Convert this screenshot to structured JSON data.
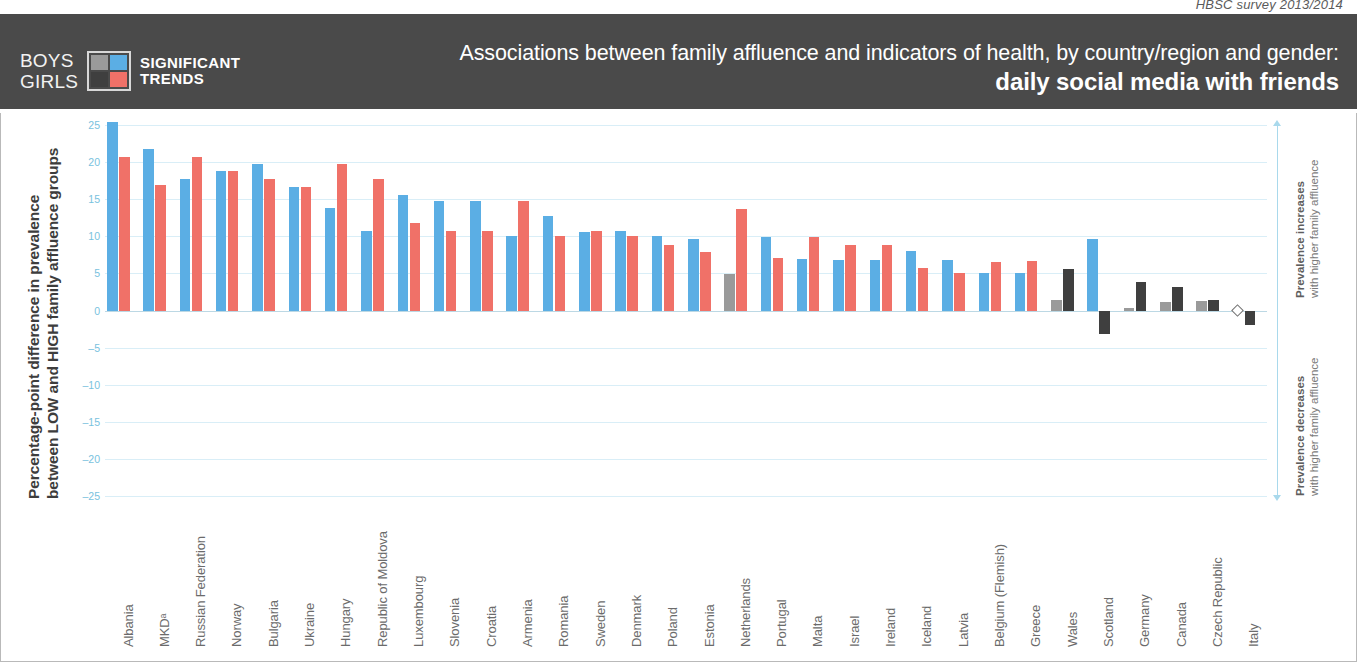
{
  "survey_note": "HBSC survey 2013/2014",
  "header": {
    "legend_rows": [
      "BOYS",
      "GIRLS"
    ],
    "legend_caption": [
      "SIGNIFICANT",
      "TRENDS"
    ],
    "swatch_colors": {
      "boys_nonsig": "#9a9a9a",
      "boys_sig": "#5BAEE4",
      "girls_nonsig": "#3f3f3f",
      "girls_sig": "#F07168"
    },
    "title_line1": "Associations between family affluence and indicators of health, by country/region and gender:",
    "title_line2": "daily social media with friends",
    "band_color": "#4a4a4a"
  },
  "axes": {
    "y_title_line1": "Percentage-point difference in prevalence",
    "y_title_line2": "between LOW and HIGH family affluence groups",
    "y_ticks": [
      25,
      20,
      15,
      10,
      5,
      0,
      -5,
      -10,
      -15,
      -20,
      -25
    ],
    "tick_color": "#79c2de"
  },
  "annotations": {
    "increase_bold": "Prevalence increases",
    "increase_rest": "with higher family affluence",
    "decrease_bold": "Prevalence decreases",
    "decrease_rest": "with higher family affluence"
  },
  "chart_data": {
    "type": "bar",
    "title": "Associations between family affluence and indicators of health, by country/region and gender: daily social media with friends",
    "subtitle": "HBSC survey 2013/2014",
    "xlabel": "",
    "ylabel": "Percentage-point difference in prevalence between LOW and HIGH family affluence groups",
    "ylim": [
      -26,
      26
    ],
    "yticks": [
      25,
      20,
      15,
      10,
      5,
      0,
      -5,
      -10,
      -15,
      -20,
      -25
    ],
    "grid": true,
    "legend": [
      "BOYS significant",
      "GIRLS significant",
      "BOYS not significant",
      "GIRLS not significant"
    ],
    "colors": {
      "boys_significant": "#5BAEE4",
      "girls_significant": "#F07168",
      "boys_nonsignificant": "#9a9a9a",
      "girls_nonsignificant": "#3f3f3f"
    },
    "categories": [
      "Albania",
      "MKDᵃ",
      "Russian Federation",
      "Norway",
      "Bulgaria",
      "Ukraine",
      "Hungary",
      "Republic of Moldova",
      "Luxembourg",
      "Slovenia",
      "Croatia",
      "Armenia",
      "Romania",
      "Sweden",
      "Denmark",
      "Poland",
      "Estonia",
      "Netherlands",
      "Portugal",
      "Malta",
      "Israel",
      "Ireland",
      "Iceland",
      "Latvia",
      "Belgium (Flemish)",
      "Greece",
      "Wales",
      "Scotland",
      "Germany",
      "Canada",
      "Czech Republic",
      "Italy"
    ],
    "series": [
      {
        "name": "BOYS",
        "values": [
          25.5,
          21.8,
          17.7,
          18.8,
          19.8,
          16.7,
          13.8,
          10.8,
          15.6,
          14.8,
          14.8,
          10.0,
          12.8,
          10.6,
          10.7,
          10.1,
          9.7,
          4.9,
          9.9,
          6.9,
          6.8,
          6.8,
          8.1,
          6.8,
          5.0,
          5.0,
          1.4,
          9.7,
          0.3,
          1.1,
          1.3,
          0.0
        ],
        "significant": [
          true,
          true,
          true,
          true,
          true,
          true,
          true,
          true,
          true,
          true,
          true,
          true,
          true,
          true,
          true,
          true,
          true,
          false,
          true,
          true,
          true,
          true,
          true,
          true,
          true,
          true,
          false,
          true,
          false,
          false,
          false,
          false
        ],
        "marker": [
          null,
          null,
          null,
          null,
          null,
          null,
          null,
          null,
          null,
          null,
          null,
          null,
          null,
          null,
          null,
          null,
          null,
          null,
          null,
          null,
          null,
          null,
          null,
          null,
          null,
          null,
          null,
          null,
          null,
          null,
          null,
          "diamond"
        ]
      },
      {
        "name": "GIRLS",
        "values": [
          20.8,
          17.0,
          20.8,
          18.8,
          17.7,
          16.7,
          19.8,
          17.7,
          11.8,
          10.8,
          10.8,
          14.8,
          10.0,
          10.8,
          10.0,
          8.8,
          7.9,
          13.7,
          7.1,
          9.9,
          8.8,
          8.8,
          5.8,
          5.0,
          6.6,
          6.7,
          5.6,
          -3.2,
          3.8,
          3.2,
          1.4,
          -2.0
        ],
        "significant": [
          true,
          true,
          true,
          true,
          true,
          true,
          true,
          true,
          true,
          true,
          true,
          true,
          true,
          true,
          true,
          true,
          true,
          true,
          true,
          true,
          true,
          true,
          true,
          true,
          true,
          true,
          false,
          false,
          false,
          false,
          false,
          false
        ]
      }
    ]
  }
}
